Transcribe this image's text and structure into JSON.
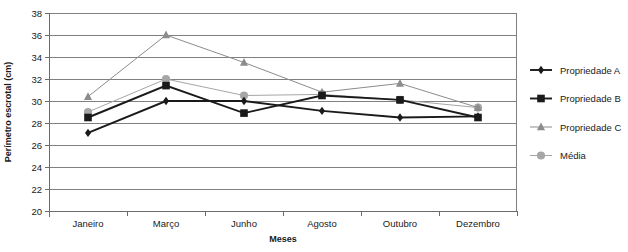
{
  "chart_data": {
    "type": "line",
    "title": "",
    "xlabel": "Meses",
    "ylabel": "Perímetro escrotal (cm)",
    "categories": [
      "Janeiro",
      "Março",
      "Junho",
      "Agosto",
      "Outubro",
      "Dezembro"
    ],
    "ylim": [
      20,
      38
    ],
    "ytick_step": 2,
    "yticks": [
      "20",
      "22",
      "24",
      "26",
      "28",
      "30",
      "32",
      "34",
      "36",
      "38"
    ],
    "grid": true,
    "legend_position": "right",
    "series": [
      {
        "name": "Propriedade A",
        "marker": "diamond",
        "color": "#1a1a1a",
        "values": [
          27.1,
          30.0,
          30.0,
          29.1,
          28.5,
          28.6
        ]
      },
      {
        "name": "Propriedade B",
        "marker": "square",
        "color": "#1a1a1a",
        "values": [
          28.5,
          31.4,
          28.9,
          30.5,
          30.1,
          28.5
        ]
      },
      {
        "name": "Propriedade C",
        "marker": "triangle",
        "color": "#8c8c8c",
        "values": [
          30.4,
          36.0,
          33.5,
          30.8,
          31.6,
          29.4
        ]
      },
      {
        "name": "Média",
        "marker": "circle",
        "color": "#a6a6a6",
        "values": [
          29.0,
          32.0,
          30.5,
          30.6,
          30.1,
          29.4
        ]
      }
    ]
  },
  "legend": {
    "items": [
      {
        "label": "Propriedade A"
      },
      {
        "label": "Propriedade B"
      },
      {
        "label": "Propriedade C"
      },
      {
        "label": "Média"
      }
    ]
  }
}
